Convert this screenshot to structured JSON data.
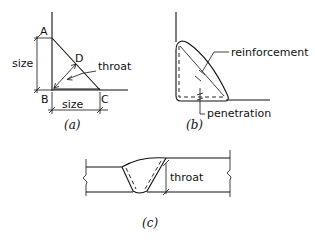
{
  "figure_a": {
    "points": {
      "A": "A",
      "B": "B",
      "C": "C",
      "D": "D"
    },
    "size_vertical_label": "size",
    "size_horizontal_label": "size",
    "throat_label": "throat",
    "caption": "(a)"
  },
  "figure_b": {
    "reinforcement_label": "reinforcement",
    "penetration_label": "penetration",
    "caption": "(b)"
  },
  "figure_c": {
    "throat_label": "throat",
    "caption": "(c)"
  },
  "colors": {
    "line": "#111111",
    "background": "#ffffff"
  }
}
